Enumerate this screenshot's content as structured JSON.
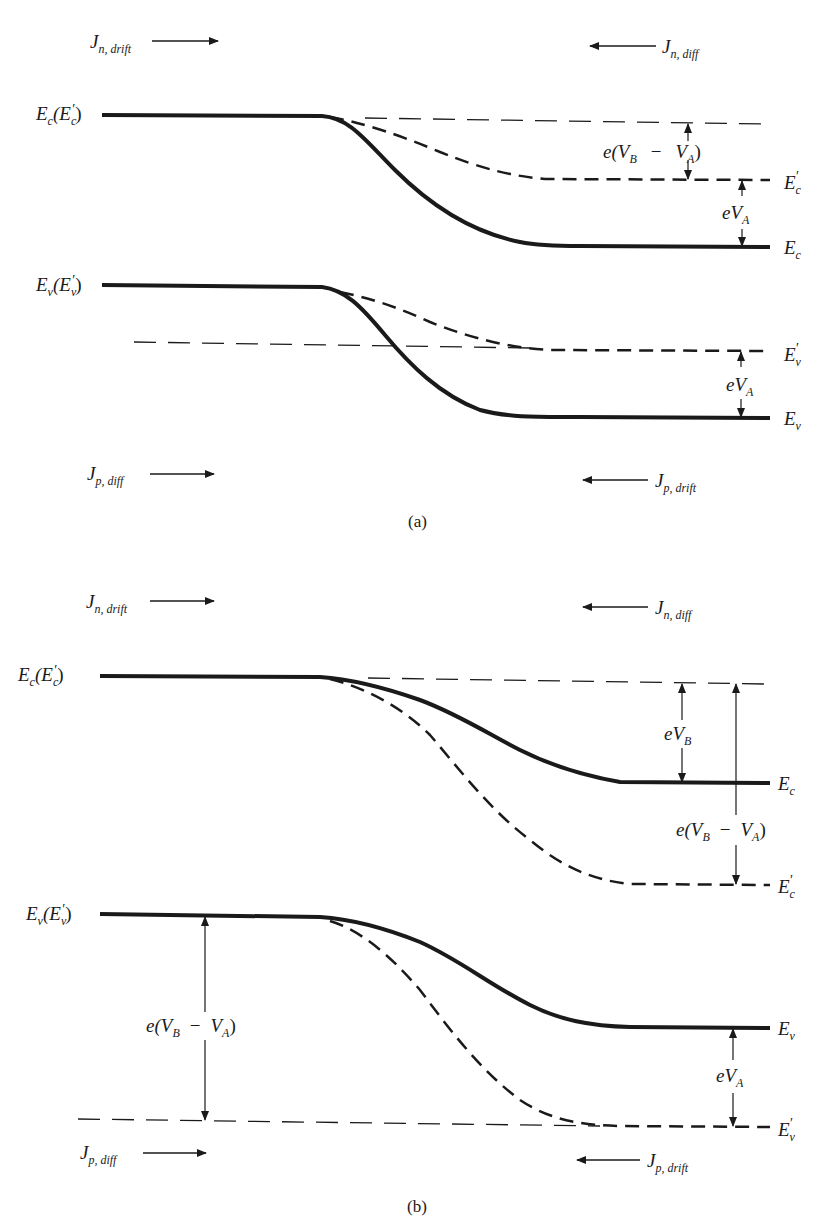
{
  "panels": [
    {
      "id": "a",
      "caption": "(a)",
      "current_labels": {
        "n_drift": {
          "symbol": "J",
          "sub": "n, drift",
          "arrow": "right"
        },
        "n_diff": {
          "symbol": "J",
          "sub": "n, diff",
          "arrow": "left"
        },
        "p_diff": {
          "symbol": "J",
          "sub": "p, diff",
          "arrow": "right"
        },
        "p_drift": {
          "symbol": "J",
          "sub": "p, drift",
          "arrow": "left"
        }
      },
      "left_labels": {
        "ec": "E",
        "ec_sub": "c",
        "ec_paren": "(E",
        "ec_paren_sub": "c",
        "ec_prime": "′",
        "ec_close": ")",
        "ev": "E",
        "ev_sub": "v",
        "ev_paren": "(E",
        "ev_paren_sub": "v",
        "ev_prime": "′",
        "ev_close": ")"
      },
      "right_labels": {
        "ec_prime": {
          "main": "E",
          "sub": "c",
          "prime": "′"
        },
        "ec": {
          "main": "E",
          "sub": "c"
        },
        "ev_prime": {
          "main": "E",
          "sub": "v",
          "prime": "′"
        },
        "ev": {
          "main": "E",
          "sub": "v"
        }
      },
      "annotations": {
        "top_gap": "e(V_B − V_A)",
        "top_gap_parts": {
          "e": "e(",
          "v1": "V",
          "v1_sub": "B",
          "minus": "−",
          "v2": "V",
          "v2_sub": "A",
          "close": ")"
        },
        "mid_gap": "eV_A",
        "mid_gap_parts": {
          "e": "e",
          "v": "V",
          "v_sub": "A"
        },
        "bottom_gap": "eV_A",
        "bottom_gap_parts": {
          "e": "e",
          "v": "V",
          "v_sub": "A"
        }
      }
    },
    {
      "id": "b",
      "caption": "(b)",
      "current_labels": {
        "n_drift": {
          "symbol": "J",
          "sub": "n, drift",
          "arrow": "right"
        },
        "n_diff": {
          "symbol": "J",
          "sub": "n, diff",
          "arrow": "left"
        },
        "p_diff": {
          "symbol": "J",
          "sub": "p, diff",
          "arrow": "right"
        },
        "p_drift": {
          "symbol": "J",
          "sub": "p, drift",
          "arrow": "left"
        }
      },
      "left_labels": {
        "ec": "E",
        "ec_sub": "c",
        "ec_paren": "(E",
        "ec_paren_sub": "c",
        "ec_prime": "′",
        "ec_close": ")",
        "ev": "E",
        "ev_sub": "v",
        "ev_paren": "(E",
        "ev_paren_sub": "v",
        "ev_prime": "′",
        "ev_close": ")"
      },
      "right_labels": {
        "ec": {
          "main": "E",
          "sub": "c"
        },
        "ec_prime": {
          "main": "E",
          "sub": "c",
          "prime": "′"
        },
        "ev": {
          "main": "E",
          "sub": "v"
        },
        "ev_prime": {
          "main": "E",
          "sub": "v",
          "prime": "′"
        }
      },
      "annotations": {
        "ebv": "eV_B",
        "ebv_parts": {
          "e": "e",
          "v": "V",
          "v_sub": "B"
        },
        "right_gap": "e(V_B − V_A)",
        "right_gap_parts": {
          "e": "e(",
          "v1": "V",
          "v1_sub": "B",
          "minus": "−",
          "v2": "V",
          "v2_sub": "A",
          "close": ")"
        },
        "left_gap": "e(V_B − V_A)",
        "left_gap_parts": {
          "e": "e(",
          "v1": "V",
          "v1_sub": "B",
          "minus": "−",
          "v2": "V",
          "v2_sub": "A",
          "close": ")"
        },
        "bottom_gap": "eV_A",
        "bottom_gap_parts": {
          "e": "e",
          "v": "V",
          "v_sub": "A"
        }
      }
    }
  ],
  "colors": {
    "ink": "#1a1a1a",
    "background": "#ffffff"
  }
}
